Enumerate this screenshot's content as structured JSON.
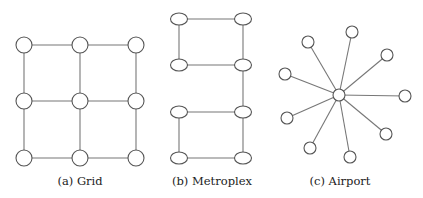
{
  "panels": [
    {
      "id": "grid",
      "caption": "(a) Grid",
      "caption_x": 80,
      "node_shape": "circle",
      "node_r": 8,
      "nodes": [
        [
          24,
          45
        ],
        [
          80,
          45
        ],
        [
          136,
          45
        ],
        [
          24,
          101
        ],
        [
          80,
          101
        ],
        [
          136,
          101
        ],
        [
          24,
          158
        ],
        [
          80,
          158
        ],
        [
          136,
          158
        ]
      ],
      "edges": [
        [
          0,
          1
        ],
        [
          1,
          2
        ],
        [
          3,
          4
        ],
        [
          4,
          5
        ],
        [
          6,
          7
        ],
        [
          7,
          8
        ],
        [
          0,
          3
        ],
        [
          3,
          6
        ],
        [
          1,
          4
        ],
        [
          4,
          7
        ],
        [
          2,
          5
        ],
        [
          5,
          8
        ]
      ]
    },
    {
      "id": "metroplex",
      "caption": "(b) Metroplex",
      "caption_x": 212,
      "node_shape": "ellipse",
      "node_rx": 8.5,
      "node_ry": 6,
      "nodes": [
        [
          179,
          19
        ],
        [
          243,
          19
        ],
        [
          179,
          65
        ],
        [
          243,
          65
        ],
        [
          179,
          112
        ],
        [
          243,
          112
        ],
        [
          179,
          158
        ],
        [
          243,
          158
        ]
      ],
      "edges": [
        [
          0,
          1
        ],
        [
          0,
          2
        ],
        [
          1,
          3
        ],
        [
          2,
          3
        ],
        [
          3,
          5
        ],
        [
          4,
          5
        ],
        [
          4,
          6
        ],
        [
          5,
          7
        ],
        [
          6,
          7
        ]
      ]
    },
    {
      "id": "airport",
      "caption": "(c) Airport",
      "caption_x": 340,
      "node_shape": "circle",
      "node_r": 6,
      "nodes": [
        [
          339,
          95
        ],
        [
          308,
          42
        ],
        [
          352,
          32
        ],
        [
          387,
          55
        ],
        [
          285,
          74
        ],
        [
          405,
          96
        ],
        [
          287,
          118
        ],
        [
          386,
          134
        ],
        [
          310,
          148
        ],
        [
          350,
          157
        ]
      ],
      "edges": [
        [
          0,
          1
        ],
        [
          0,
          2
        ],
        [
          0,
          3
        ],
        [
          0,
          4
        ],
        [
          0,
          5
        ],
        [
          0,
          6
        ],
        [
          0,
          7
        ],
        [
          0,
          8
        ],
        [
          0,
          9
        ]
      ]
    }
  ]
}
